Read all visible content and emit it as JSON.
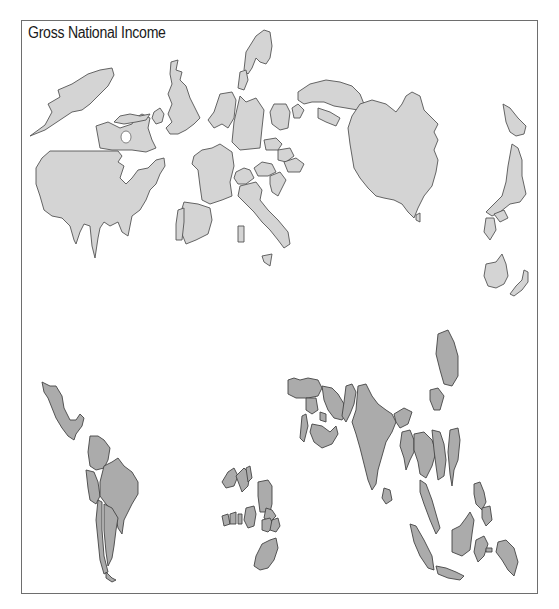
{
  "map": {
    "title": "Gross National Income",
    "type": "cartogram",
    "colors": {
      "high_income_fill": "#d4d4d4",
      "lower_income_fill": "#ababab",
      "outline": "#555555",
      "frame": "#6e6e6e",
      "background": "#ffffff"
    },
    "regions": {
      "north_america": [
        "Alaska",
        "Canada",
        "United States"
      ],
      "europe": [
        "Iceland",
        "Ireland",
        "United Kingdom",
        "Norway",
        "Sweden",
        "Finland",
        "Denmark",
        "Netherlands",
        "Belgium",
        "Germany",
        "France",
        "Switzerland",
        "Austria",
        "Italy",
        "Spain",
        "Portugal",
        "Poland",
        "Czech Republic",
        "Hungary",
        "Greece",
        "Russia"
      ],
      "east_asia_pacific": [
        "China",
        "Japan",
        "South Korea",
        "Taiwan",
        "Australia",
        "New Zealand"
      ],
      "latin_america": [
        "Mexico",
        "Colombia",
        "Venezuela",
        "Peru",
        "Brazil",
        "Chile",
        "Argentina"
      ],
      "africa": [
        "Morocco",
        "Algeria",
        "Egypt",
        "Nigeria",
        "South Africa"
      ],
      "south_asia_middle_east": [
        "Turkey",
        "Iran",
        "Saudi Arabia",
        "Pakistan",
        "India",
        "Sri Lanka",
        "Bangladesh",
        "Myanmar",
        "Thailand",
        "Vietnam"
      ],
      "southeast_asia": [
        "Malaysia",
        "Indonesia",
        "Philippines",
        "Papua New Guinea"
      ]
    }
  }
}
